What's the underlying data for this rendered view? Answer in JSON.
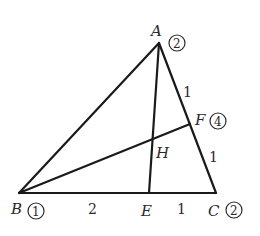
{
  "figure": {
    "points": {
      "A": {
        "label": "A",
        "weight": "2",
        "x": 159,
        "y": 43
      },
      "B": {
        "label": "B",
        "weight": "1",
        "x": 19,
        "y": 193
      },
      "C": {
        "label": "C",
        "weight": "2",
        "x": 216,
        "y": 193
      },
      "E": {
        "label": "E",
        "x": 149,
        "y": 193
      },
      "F": {
        "label": "F",
        "weight": "4",
        "x": 190,
        "y": 124
      },
      "H": {
        "label": "H",
        "x": 152,
        "y": 138
      }
    },
    "segments": [
      "AB",
      "AC",
      "BC",
      "AE",
      "BF"
    ],
    "lengths": {
      "AF": "1",
      "FC": "1",
      "BE": "2",
      "EC": "1"
    }
  }
}
